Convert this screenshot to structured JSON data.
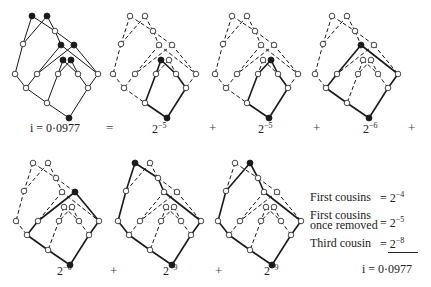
{
  "figure": {
    "total_label": "i = 0·0977",
    "equals": "=",
    "plus": "+",
    "node_layout": {
      "A": [
        32,
        16
      ],
      "B": [
        47,
        16
      ],
      "C": [
        55,
        31
      ],
      "D": [
        23,
        44
      ],
      "E": [
        61,
        45
      ],
      "F": [
        74,
        45
      ],
      "G": [
        63,
        60
      ],
      "H": [
        71,
        60
      ],
      "I": [
        15,
        74
      ],
      "J": [
        37,
        74
      ],
      "K": [
        58,
        74
      ],
      "L": [
        78,
        74
      ],
      "M": [
        98,
        74
      ],
      "N": [
        26,
        88
      ],
      "O": [
        88,
        88
      ],
      "P": [
        47,
        103
      ],
      "Q": [
        69,
        118
      ]
    },
    "edges": [
      [
        "A",
        "D"
      ],
      [
        "A",
        "C"
      ],
      [
        "B",
        "D"
      ],
      [
        "B",
        "C"
      ],
      [
        "D",
        "I"
      ],
      [
        "C",
        "E"
      ],
      [
        "C",
        "F"
      ],
      [
        "E",
        "J"
      ],
      [
        "E",
        "M"
      ],
      [
        "F",
        "J"
      ],
      [
        "F",
        "M"
      ],
      [
        "G",
        "K"
      ],
      [
        "G",
        "L"
      ],
      [
        "H",
        "K"
      ],
      [
        "H",
        "L"
      ],
      [
        "I",
        "N"
      ],
      [
        "J",
        "N"
      ],
      [
        "K",
        "P"
      ],
      [
        "L",
        "O"
      ],
      [
        "M",
        "O"
      ],
      [
        "N",
        "P"
      ],
      [
        "P",
        "Q"
      ],
      [
        "O",
        "Q"
      ]
    ],
    "panels": [
      {
        "id": "full",
        "offset": [
          0,
          0
        ],
        "label": "i = 0·0977",
        "label_pos": [
          30,
          128
        ],
        "filled": [
          "A",
          "B",
          "E",
          "F",
          "G",
          "H",
          "Q"
        ],
        "solid": "all"
      },
      {
        "id": "p1",
        "offset": [
          98,
          0
        ],
        "label_base": "2",
        "label_exp": "−5",
        "label_pos": [
          152,
          128
        ],
        "filled": [
          "G",
          "Q"
        ],
        "solid": [
          [
            "G",
            "K"
          ],
          [
            "K",
            "P"
          ],
          [
            "P",
            "Q"
          ],
          [
            "G",
            "L"
          ],
          [
            "L",
            "O"
          ],
          [
            "O",
            "Q"
          ]
        ]
      },
      {
        "id": "p2",
        "offset": [
          200,
          0
        ],
        "label_base": "2",
        "label_exp": "−5",
        "label_pos": [
          258,
          128
        ],
        "filled": [
          "H",
          "Q"
        ],
        "solid": [
          [
            "H",
            "K"
          ],
          [
            "K",
            "P"
          ],
          [
            "P",
            "Q"
          ],
          [
            "H",
            "L"
          ],
          [
            "L",
            "O"
          ],
          [
            "O",
            "Q"
          ]
        ]
      },
      {
        "id": "p3",
        "offset": [
          300,
          0
        ],
        "label_base": "2",
        "label_exp": "−6",
        "label_pos": [
          363,
          128
        ],
        "filled": [
          "E",
          "Q"
        ],
        "solid": [
          [
            "E",
            "J"
          ],
          [
            "J",
            "N"
          ],
          [
            "N",
            "P"
          ],
          [
            "P",
            "Q"
          ],
          [
            "E",
            "M"
          ],
          [
            "M",
            "O"
          ],
          [
            "O",
            "Q"
          ]
        ]
      },
      {
        "id": "p4",
        "offset": [
          1,
          147
        ],
        "label_base": "2",
        "label_exp": "−6",
        "label_pos": [
          57,
          270
        ],
        "filled": [
          "F",
          "Q"
        ],
        "solid": [
          [
            "F",
            "J"
          ],
          [
            "J",
            "N"
          ],
          [
            "N",
            "P"
          ],
          [
            "P",
            "Q"
          ],
          [
            "F",
            "M"
          ],
          [
            "M",
            "O"
          ],
          [
            "O",
            "Q"
          ]
        ]
      },
      {
        "id": "p5",
        "offset": [
          103,
          147
        ],
        "label_base": "2",
        "label_exp": "−9",
        "label_pos": [
          163,
          270
        ],
        "filled": [
          "A",
          "Q"
        ],
        "solid": [
          [
            "A",
            "D"
          ],
          [
            "D",
            "I"
          ],
          [
            "I",
            "N"
          ],
          [
            "N",
            "P"
          ],
          [
            "P",
            "Q"
          ],
          [
            "A",
            "C"
          ],
          [
            "C",
            "E"
          ],
          [
            "E",
            "M"
          ],
          [
            "M",
            "O"
          ],
          [
            "O",
            "Q"
          ]
        ]
      },
      {
        "id": "p6",
        "offset": [
          203,
          147
        ],
        "label_base": "2",
        "label_exp": "−9",
        "label_pos": [
          264,
          270
        ],
        "filled": [
          "B",
          "Q"
        ],
        "solid": [
          [
            "B",
            "D"
          ],
          [
            "D",
            "I"
          ],
          [
            "I",
            "N"
          ],
          [
            "N",
            "P"
          ],
          [
            "P",
            "Q"
          ],
          [
            "B",
            "C"
          ],
          [
            "C",
            "E"
          ],
          [
            "E",
            "M"
          ],
          [
            "M",
            "O"
          ],
          [
            "O",
            "Q"
          ]
        ]
      }
    ],
    "operators": [
      {
        "text": "=",
        "pos": [
          106,
          127
        ]
      },
      {
        "text": "+",
        "pos": [
          209,
          127
        ]
      },
      {
        "text": "+",
        "pos": [
          313,
          127
        ]
      },
      {
        "text": "+",
        "pos": [
          408,
          127
        ]
      },
      {
        "text": "+",
        "pos": [
          110,
          270
        ]
      },
      {
        "text": "+",
        "pos": [
          215,
          270
        ]
      }
    ]
  },
  "legend": {
    "first_cousins": {
      "name": "First cousins",
      "base": "2",
      "exp": "−4"
    },
    "first_cousins_removed": {
      "name_line1": "First cousins",
      "name_line2": "once removed",
      "base": "2",
      "exp": "−5"
    },
    "third_cousin": {
      "name": "Third cousin",
      "base": "2",
      "exp": "−8"
    },
    "total": "i = 0·0977"
  },
  "colors": {
    "ink": "#1a1a1a",
    "background": "#ffffff"
  }
}
